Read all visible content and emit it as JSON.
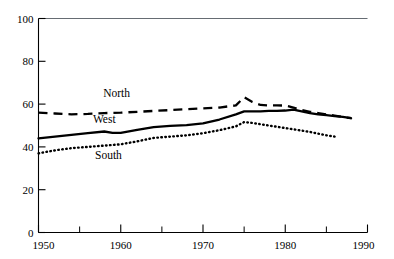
{
  "chart_data": {
    "type": "line",
    "title": "",
    "xlabel": "",
    "ylabel": "",
    "xlim": [
      1950,
      1990
    ],
    "ylim": [
      0,
      100
    ],
    "grid": false,
    "legend_position": "inline-labels",
    "x_ticks": [
      1950,
      1955,
      1960,
      1965,
      1970,
      1975,
      1980,
      1985,
      1990
    ],
    "x_tick_labels": [
      "1950",
      "",
      "1960",
      "",
      "1970",
      "",
      "1980",
      "",
      "1990"
    ],
    "y_ticks": [
      0,
      20,
      40,
      60,
      80,
      100
    ],
    "y_tick_labels": [
      "0",
      "20",
      "40",
      "60",
      "80",
      "100"
    ],
    "series": [
      {
        "name": "North",
        "style": "dashed",
        "label_x": 1959.5,
        "label_y": 63.5,
        "x": [
          1950,
          1952,
          1954,
          1956,
          1958,
          1960,
          1962,
          1964,
          1966,
          1968,
          1970,
          1972,
          1974,
          1975,
          1976,
          1977,
          1978,
          1979,
          1980,
          1981,
          1982,
          1983,
          1984,
          1985,
          1986,
          1987,
          1988
        ],
        "values": [
          56.0,
          55.6,
          55.2,
          55.4,
          55.8,
          56.0,
          56.4,
          56.8,
          57.2,
          57.6,
          58.0,
          58.4,
          59.4,
          63.2,
          61.0,
          59.6,
          59.4,
          59.4,
          59.3,
          58.4,
          57.2,
          56.4,
          55.8,
          55.2,
          54.6,
          54.0,
          53.4
        ]
      },
      {
        "name": "West",
        "style": "solid",
        "label_x": 1958.0,
        "label_y": 51.0,
        "x": [
          1950,
          1952,
          1954,
          1956,
          1958,
          1959,
          1960,
          1962,
          1964,
          1966,
          1968,
          1970,
          1972,
          1974,
          1975,
          1976,
          1977,
          1978,
          1979,
          1980,
          1981,
          1982,
          1983,
          1984,
          1985,
          1986,
          1987,
          1988
        ],
        "values": [
          44.0,
          44.8,
          45.6,
          46.4,
          47.2,
          46.6,
          46.6,
          48.0,
          49.2,
          49.8,
          50.2,
          51.0,
          52.8,
          55.2,
          56.6,
          56.6,
          56.6,
          56.8,
          56.8,
          57.0,
          57.4,
          56.6,
          55.8,
          55.2,
          54.8,
          54.4,
          54.0,
          53.4
        ]
      },
      {
        "name": "South",
        "style": "dotted",
        "label_x": 1958.5,
        "label_y": 34.5,
        "x": [
          1950,
          1952,
          1954,
          1956,
          1958,
          1960,
          1962,
          1964,
          1966,
          1968,
          1970,
          1972,
          1974,
          1975,
          1976,
          1977,
          1978,
          1979,
          1980,
          1981,
          1982,
          1983,
          1984,
          1985,
          1986
        ],
        "values": [
          37.0,
          38.4,
          39.4,
          40.0,
          40.6,
          41.2,
          42.6,
          44.2,
          44.8,
          45.4,
          46.4,
          47.8,
          49.6,
          51.6,
          51.2,
          50.6,
          50.0,
          49.4,
          48.8,
          48.2,
          47.6,
          47.0,
          46.2,
          45.4,
          44.8
        ]
      }
    ]
  },
  "axis": {
    "y_axis_name": "value-axis",
    "x_axis_name": "year-axis"
  }
}
